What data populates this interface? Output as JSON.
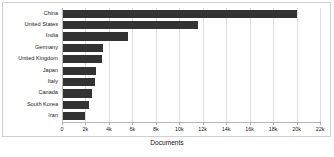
{
  "chart_data": {
    "type": "bar",
    "orientation": "horizontal",
    "title": "",
    "xlabel": "Documents",
    "ylabel": "",
    "xlim": [
      0,
      22000
    ],
    "grid": true,
    "legend": null,
    "bar_color": "#333333",
    "categories": [
      "China",
      "United States",
      "India",
      "Germany",
      "United Kingdom",
      "Japan",
      "Italy",
      "Canada",
      "South Korea",
      "Iran"
    ],
    "values": [
      20000,
      11600,
      5600,
      3500,
      3450,
      2900,
      2800,
      2600,
      2300,
      2000
    ],
    "tick_values": [
      0,
      2000,
      4000,
      6000,
      8000,
      10000,
      12000,
      14000,
      16000,
      18000,
      20000,
      22000
    ],
    "tick_labels": [
      "0",
      "2k",
      "4k",
      "6k",
      "8k",
      "10k",
      "12k",
      "14k",
      "16k",
      "18k",
      "20k",
      "22k"
    ]
  }
}
